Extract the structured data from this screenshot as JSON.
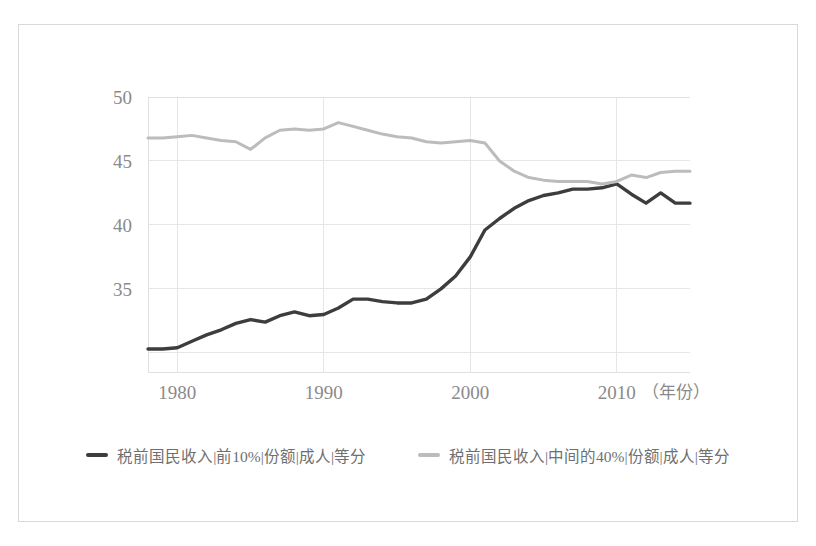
{
  "figure": {
    "background_color": "#ffffff",
    "frame_color": "#d9d9d9"
  },
  "chart_data": {
    "type": "line",
    "title": "",
    "subtitle": "",
    "xlabel": "（年份）",
    "ylabel": "",
    "xlim": [
      1978,
      2015
    ],
    "ylim": [
      28.5,
      50
    ],
    "xticks": [
      1980,
      1990,
      2000,
      2010
    ],
    "xtick_labels": [
      "1980",
      "1990",
      "2000",
      "2010"
    ],
    "yticks": [
      30,
      35,
      40,
      45,
      50
    ],
    "ytick_labels": [
      "",
      "35",
      "40",
      "45",
      "50"
    ],
    "grid": true,
    "grid_color": "#e6e6e6",
    "legend_position": "bottom",
    "x": [
      1978,
      1979,
      1980,
      1981,
      1982,
      1983,
      1984,
      1985,
      1986,
      1987,
      1988,
      1989,
      1990,
      1991,
      1992,
      1993,
      1994,
      1995,
      1996,
      1997,
      1998,
      1999,
      2000,
      2001,
      2002,
      2003,
      2004,
      2005,
      2006,
      2007,
      2008,
      2009,
      2010,
      2011,
      2012,
      2013,
      2014,
      2015
    ],
    "series": [
      {
        "name": "税前国民收入|前10%|份额|成人|等分",
        "color": "#3d3d3d",
        "width": 3.4,
        "values": [
          30.3,
          30.3,
          30.4,
          30.9,
          31.4,
          31.8,
          32.3,
          32.6,
          32.4,
          32.9,
          33.2,
          32.9,
          33.0,
          33.5,
          34.2,
          34.2,
          34.0,
          33.9,
          33.9,
          34.2,
          35.0,
          36.0,
          37.5,
          39.6,
          40.5,
          41.3,
          41.9,
          42.3,
          42.5,
          42.8,
          42.8,
          42.9,
          43.2,
          42.4,
          41.7,
          42.5,
          41.7,
          41.7
        ]
      },
      {
        "name": "税前国民收入|中间的40%|份额|成人|等分",
        "color": "#bcbcbc",
        "width": 3.0,
        "values": [
          46.8,
          46.8,
          46.9,
          47.0,
          46.8,
          46.6,
          46.5,
          45.9,
          46.8,
          47.4,
          47.5,
          47.4,
          47.5,
          48.0,
          47.7,
          47.4,
          47.1,
          46.9,
          46.8,
          46.5,
          46.4,
          46.5,
          46.6,
          46.4,
          45.0,
          44.2,
          43.7,
          43.5,
          43.4,
          43.4,
          43.4,
          43.2,
          43.4,
          43.9,
          43.7,
          44.1,
          44.2,
          44.2
        ]
      }
    ]
  },
  "legend": {
    "entries": [
      {
        "label": "税前国民收入|前10%|份额|成人|等分",
        "color": "#3d3d3d"
      },
      {
        "label": "税前国民收入|中间的40%|份额|成人|等分",
        "color": "#bcbcbc"
      }
    ]
  }
}
